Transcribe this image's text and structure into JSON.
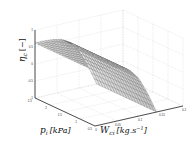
{
  "chart_data": {
    "type": "surface",
    "title": "",
    "xlabel": "W_ci [kg.s^-1]",
    "ylabel": "p_i [kPa]",
    "zlabel": "η_c [−]",
    "xlabel_parts": {
      "base": "W",
      "sub": "ci",
      "unit": "[kg.s",
      "sup": "−1",
      "close": "]"
    },
    "ylabel_parts": {
      "base": "p",
      "sub": "i",
      "unit": "[kPa]"
    },
    "zlabel_parts": {
      "base": "η",
      "sub": "c",
      "unit": "[−]"
    },
    "x_ticks": [
      "0",
      "0.05",
      "0.1",
      "0.15",
      "0.2"
    ],
    "y_ticks": [
      "2.5",
      "2",
      "1.5",
      "1",
      "0.5"
    ],
    "z_ticks": [
      "-1",
      "-0.5",
      "0",
      "0.5",
      "1"
    ],
    "xlim": [
      0,
      0.2
    ],
    "ylim": [
      0.5,
      2.5
    ],
    "zlim": [
      -1,
      1
    ],
    "grid": true,
    "surface_description": "Efficiency near 0.6 across low mass flow, plateau over pressure; drops steeply to -1 as mass flow increases past ~0.1",
    "surface_samples": {
      "W": [
        0,
        0.02,
        0.04,
        0.06,
        0.08,
        0.1,
        0.12,
        0.14
      ],
      "eta_c": [
        0.62,
        0.62,
        0.6,
        0.55,
        0.4,
        0.1,
        -0.4,
        -1.0
      ]
    },
    "colors": {
      "mesh": "#555555",
      "face": "#d9d9d9",
      "grid": "#cccccc",
      "axis": "#222222"
    }
  }
}
